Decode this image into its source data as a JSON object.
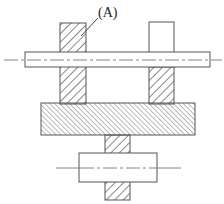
{
  "diagram": {
    "type": "mechanical-section-drawing",
    "labels": {
      "part_a": "(A)"
    },
    "colors": {
      "stroke": "#555555",
      "hatch": "#555555",
      "background": "#ffffff"
    },
    "parts": [
      {
        "id": "upper-shaft",
        "hatched": false,
        "has_centerline": true
      },
      {
        "id": "left-column",
        "hatched": true,
        "label": "(A)"
      },
      {
        "id": "right-column-upper",
        "hatched": false
      },
      {
        "id": "right-column-lower",
        "hatched": true
      },
      {
        "id": "base-plate",
        "hatched": true,
        "hatch_density": "fine"
      },
      {
        "id": "lower-column",
        "hatched": true
      },
      {
        "id": "lower-shaft",
        "hatched": false,
        "has_centerline": true
      }
    ]
  }
}
